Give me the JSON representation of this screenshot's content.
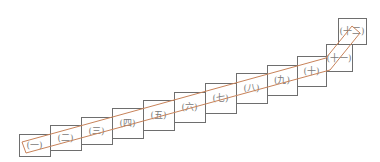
{
  "diagram": {
    "type": "staircase-of-boxes",
    "colors": {
      "box_stroke": "#6e6e6e",
      "band_stroke": "#c8835a",
      "label": "#7a7a7a",
      "background": "#ffffff"
    },
    "boxes": [
      {
        "label": "(一)",
        "x": 19,
        "y": 134,
        "w": 31,
        "h": 22
      },
      {
        "label": "(二)",
        "x": 50,
        "y": 125,
        "w": 31,
        "h": 25
      },
      {
        "label": "(三)",
        "x": 81,
        "y": 117,
        "w": 31,
        "h": 27
      },
      {
        "label": "(四)",
        "x": 112,
        "y": 108,
        "w": 31,
        "h": 30
      },
      {
        "label": "(五)",
        "x": 143,
        "y": 100,
        "w": 31,
        "h": 30
      },
      {
        "label": "(六)",
        "x": 174,
        "y": 92,
        "w": 31,
        "h": 30
      },
      {
        "label": "(七)",
        "x": 205,
        "y": 83,
        "w": 31,
        "h": 30
      },
      {
        "label": "(八)",
        "x": 236,
        "y": 73,
        "w": 31,
        "h": 30
      },
      {
        "label": "(九)",
        "x": 267,
        "y": 65,
        "w": 30,
        "h": 30
      },
      {
        "label": "(十)",
        "x": 297,
        "y": 56,
        "w": 29,
        "h": 30
      },
      {
        "label": "(十一)",
        "x": 326,
        "y": 44,
        "w": 26,
        "h": 27
      },
      {
        "label": "(十二)",
        "x": 338,
        "y": 18,
        "w": 28,
        "h": 26
      }
    ],
    "band": {
      "upper": "M22,142 L326,58 L352,26",
      "lower": "M26,153 L330,70 L360,33"
    }
  }
}
